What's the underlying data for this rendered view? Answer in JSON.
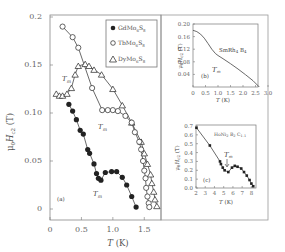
{
  "chart_data": [
    {
      "id": "a",
      "type": "scatter",
      "panel_label": "(a)",
      "xlabel": "T (K)",
      "ylabel": "μ0Hc2 (T)",
      "xlim": [
        0,
        1.75
      ],
      "ylim": [
        -0.01,
        0.2
      ],
      "xticks": [
        0,
        0.5,
        1.0,
        1.5
      ],
      "xtick_labels": [
        "0",
        "0.5",
        "1.0",
        "1.5"
      ],
      "yticks": [
        0,
        0.05,
        0.1,
        0.15,
        0.2
      ],
      "ytick_labels": [
        "0",
        "0.05",
        "0.10",
        "0.15",
        "0.2"
      ],
      "legend": "top-right",
      "annotations": [
        {
          "text": "Tm",
          "x": 0.22,
          "y": 0.132
        },
        {
          "text": "Tm",
          "x": 0.83,
          "y": 0.092
        },
        {
          "text": "Tm",
          "x": 0.7,
          "y": 0.015
        }
      ],
      "series": [
        {
          "name": "GdMo6S8",
          "marker": "filled-circle",
          "x": [
            0.3,
            0.36,
            0.42,
            0.48,
            0.53,
            0.6,
            0.63,
            0.7,
            0.74,
            0.77,
            0.81,
            0.88,
            0.98,
            1.06,
            1.15,
            1.22,
            1.3,
            1.37
          ],
          "y": [
            0.109,
            0.102,
            0.093,
            0.082,
            0.078,
            0.062,
            0.058,
            0.047,
            0.037,
            0.032,
            0.03,
            0.038,
            0.039,
            0.039,
            0.033,
            0.025,
            0.013,
            0.002
          ]
        },
        {
          "name": "TbMo6S8",
          "marker": "open-circle",
          "x": [
            0.2,
            0.36,
            0.45,
            0.67,
            0.83,
            0.92,
            1.0,
            1.08,
            1.2,
            1.3,
            1.35,
            1.42,
            1.45,
            1.48,
            1.5,
            1.52,
            1.53,
            1.55,
            1.57,
            1.58
          ],
          "y": [
            0.19,
            0.179,
            0.168,
            0.126,
            0.103,
            0.103,
            0.103,
            0.102,
            0.097,
            0.09,
            0.08,
            0.07,
            0.062,
            0.05,
            0.04,
            0.032,
            0.022,
            0.013,
            0.006,
            0.002
          ]
        },
        {
          "name": "DyMo6S8",
          "marker": "open-triangle",
          "x": [
            0.1,
            0.15,
            0.2,
            0.27,
            0.34,
            0.4,
            0.45,
            0.56,
            0.62,
            0.7,
            0.82,
            1.0,
            1.15,
            1.3,
            1.45,
            1.5,
            1.55,
            1.6,
            1.62,
            1.65,
            1.67,
            1.7
          ],
          "y": [
            0.12,
            0.118,
            0.118,
            0.12,
            0.126,
            0.14,
            0.149,
            0.151,
            0.149,
            0.145,
            0.14,
            0.125,
            0.108,
            0.09,
            0.07,
            0.058,
            0.047,
            0.036,
            0.027,
            0.018,
            0.01,
            0.003
          ]
        }
      ]
    },
    {
      "id": "b",
      "type": "line",
      "panel_label": "(b)",
      "title": "SmRh4B4",
      "xlabel": "T (K)",
      "ylabel": "μ0Hc2 (T)",
      "xlim": [
        0,
        3.0
      ],
      "ylim": [
        0,
        0.2
      ],
      "xticks": [
        0,
        0.5,
        1.0,
        1.5,
        2.0,
        2.5,
        3.0
      ],
      "xtick_labels": [
        "0",
        "0.5",
        "1.0",
        "1.5",
        "2.0",
        "2.5",
        "3.0"
      ],
      "yticks": [
        0.04,
        0.08,
        0.12,
        0.16,
        0.2
      ],
      "ytick_labels": [
        "0.04",
        "0.08",
        "0.12",
        "0.16",
        "0.20"
      ],
      "annotations": [
        {
          "text": "Tm",
          "x": 0.75,
          "y": 0.05
        }
      ],
      "series": [
        {
          "name": "SmRh4B4",
          "x": [
            0,
            0.15,
            0.3,
            0.45,
            0.6,
            0.75,
            0.9,
            1.0,
            1.2,
            1.5,
            1.8,
            2.1,
            2.4,
            2.65
          ],
          "y": [
            0.18,
            0.176,
            0.168,
            0.155,
            0.138,
            0.12,
            0.106,
            0.1,
            0.09,
            0.074,
            0.057,
            0.039,
            0.02,
            0.0
          ]
        }
      ]
    },
    {
      "id": "c",
      "type": "scatter",
      "panel_label": "(c)",
      "title": "HoNi2B2C1.1",
      "xlabel": "T (K)",
      "ylabel": "μ0Hc2 (T)",
      "xlim": [
        2,
        8.5
      ],
      "ylim": [
        0,
        0.7
      ],
      "xticks": [
        2,
        3,
        4,
        5,
        6,
        7,
        8
      ],
      "xtick_labels": [
        "2",
        "3",
        "4",
        "5",
        "6",
        "7",
        "8"
      ],
      "yticks": [
        0.0,
        0.1,
        0.2,
        0.3,
        0.4,
        0.5,
        0.6,
        0.7
      ],
      "ytick_labels": [
        "0.0",
        "0.1",
        "0.2",
        "0.3",
        "0.4",
        "0.5",
        "0.6",
        "0.7"
      ],
      "annotations": [
        {
          "text": "Tm",
          "x": 5.6,
          "y": 0.37,
          "arrow": true
        }
      ],
      "series": [
        {
          "name": "HoNi2B2C1.1",
          "marker": "filled-square",
          "x": [
            2.05,
            3.5,
            4.6,
            4.7,
            4.9,
            5.1,
            5.5,
            5.9,
            6.2,
            6.5,
            6.9,
            7.2,
            7.5,
            7.8,
            8.0,
            8.2
          ],
          "y": [
            0.68,
            0.48,
            0.3,
            0.27,
            0.23,
            0.2,
            0.18,
            0.23,
            0.25,
            0.24,
            0.22,
            0.18,
            0.14,
            0.09,
            0.05,
            0.02
          ]
        }
      ]
    }
  ],
  "labels": {
    "main_ylabel_mu": "μ",
    "main_ylabel_sub0": "0",
    "main_ylabel_H": "H",
    "main_ylabel_subc2": "c2",
    "main_ylabel_unit": " (T)",
    "xlabel_T": "T",
    "xlabel_unit": " (K)",
    "tm_T": "T",
    "tm_sub": "m",
    "legend": [
      {
        "base": "GdMo",
        "s1": "6",
        "mid": "S",
        "s2": "8"
      },
      {
        "base": "TbMo",
        "s1": "6",
        "mid": "S",
        "s2": "8"
      },
      {
        "base": "DyMo",
        "s1": "6",
        "mid": "S",
        "s2": "8"
      }
    ],
    "b_title": {
      "p1": "SmRh",
      "s1": "4",
      "p2": " B",
      "s2": "4"
    },
    "c_title": {
      "p1": "HoNi",
      "s1": "2",
      "p2": " B",
      "s2": "2",
      "p3": " C",
      "s3": "1.1"
    }
  },
  "colors": {
    "axis": "#777777",
    "marker": "#222222",
    "line": "#444444",
    "frame": "#999999"
  }
}
